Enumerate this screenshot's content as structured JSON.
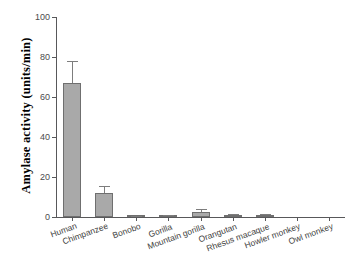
{
  "chart_data": {
    "type": "bar",
    "title": "",
    "xlabel": "",
    "ylabel": "Amylase activity (units/min)",
    "ylim": [
      0,
      100
    ],
    "yticks": [
      0,
      20,
      40,
      60,
      80,
      100
    ],
    "ytick_labels": [
      "0",
      "20",
      "40",
      "60",
      "80",
      "100"
    ],
    "grid": false,
    "legend": "none",
    "bar_color": "#a9a9a9",
    "bar_edge_color": "#6f6f6f",
    "error_bar_color": "#7d7d7d",
    "axis_color": "#58585a",
    "categories": [
      "Human",
      "Chimpanzee",
      "Bonobo",
      "Gorilla",
      "Mountain gorilla",
      "Orangutan",
      "Rhesus macaque",
      "Howler monkey",
      "Owl monkey"
    ],
    "values": [
      67,
      12,
      0.3,
      0.6,
      2.3,
      0.8,
      0.8,
      0,
      0
    ],
    "errors": [
      11,
      3.5,
      0.3,
      0.6,
      1.5,
      0.6,
      0.6,
      0,
      0
    ]
  }
}
